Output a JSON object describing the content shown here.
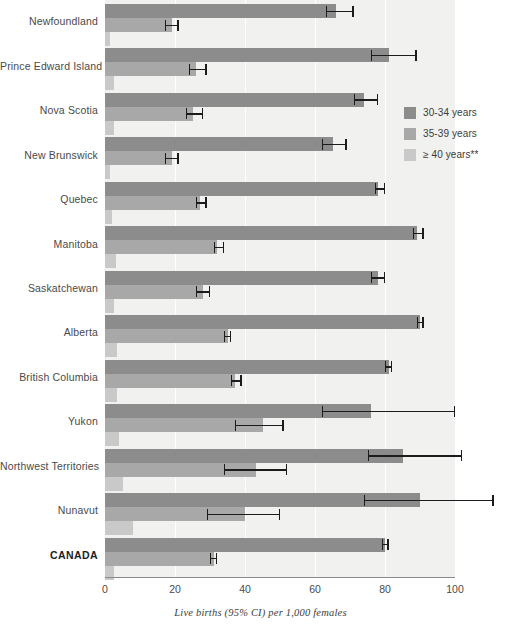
{
  "chart_data": {
    "type": "bar",
    "orientation": "horizontal",
    "title": "",
    "xlabel": "Live births (95% CI) per 1,000 females",
    "ylabel": "",
    "xlim": [
      0,
      100
    ],
    "xticks": [
      0,
      20,
      40,
      60,
      80,
      100
    ],
    "grid": true,
    "legend_position": "right-top",
    "categories": [
      "Newfoundland",
      "Prince Edward Island",
      "Nova Scotia",
      "New Brunswick",
      "Quebec",
      "Manitoba",
      "Saskatchewan",
      "Alberta",
      "British Columbia",
      "Yukon",
      "Northwest Territories",
      "Nunavut",
      "CANADA"
    ],
    "series": [
      {
        "name": "30-34 years",
        "color": "#8c8c8c",
        "values": [
          66,
          81,
          74,
          65,
          78,
          89,
          78,
          90,
          81,
          76,
          85,
          90,
          80
        ],
        "ci_low": [
          63,
          76,
          71,
          62,
          77,
          88,
          76,
          89,
          80,
          62,
          75,
          74,
          79
        ],
        "ci_high": [
          71,
          89,
          78,
          69,
          80,
          91,
          80,
          91,
          82,
          100,
          102,
          111,
          81
        ]
      },
      {
        "name": "35-39 years",
        "color": "#a8a8a8",
        "values": [
          19,
          26,
          25,
          19,
          27,
          32,
          28,
          35,
          37,
          45,
          43,
          40,
          31
        ],
        "ci_low": [
          17,
          24,
          23,
          17,
          26,
          31,
          26,
          34,
          36,
          37,
          34,
          29,
          30
        ],
        "ci_high": [
          21,
          29,
          28,
          21,
          29,
          34,
          30,
          36,
          39,
          51,
          52,
          50,
          32
        ]
      },
      {
        "name": "≥ 40 years**",
        "color": "#c9c9c9",
        "values": [
          1.5,
          2.5,
          2.5,
          1.5,
          2.0,
          3.0,
          2.5,
          3.5,
          3.5,
          4.0,
          5.0,
          8.0,
          2.5
        ]
      }
    ]
  },
  "legend": {
    "items": [
      {
        "label": "30-34 years",
        "color": "#8c8c8c"
      },
      {
        "label": "35-39 years",
        "color": "#a8a8a8"
      },
      {
        "label": "≥ 40 years**",
        "color": "#c9c9c9"
      }
    ]
  },
  "axis": {
    "tick_labels": [
      "0",
      "20",
      "40",
      "60",
      "80",
      "100"
    ],
    "caption": "Live births (95% CI) per 1,000 females"
  }
}
